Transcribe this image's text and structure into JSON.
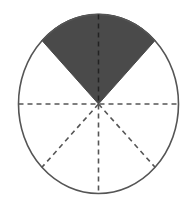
{
  "diagram": {
    "shape": "circle",
    "total_parts": 8,
    "shaded_parts": 2,
    "shaded_fraction": "2/8",
    "shaded_position": "top",
    "divider_style": "dashed",
    "colors": {
      "shade": "#4a4a4a",
      "outline": "#555555",
      "divider": "#555555",
      "background": "#ffffff"
    }
  }
}
